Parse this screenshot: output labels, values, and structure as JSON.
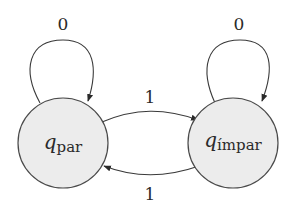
{
  "diagram": {
    "type": "finite-state-automaton",
    "states": [
      {
        "id": "q_par",
        "symbol": "q",
        "subscript": "par",
        "cx": 63,
        "cy": 143,
        "r": 45
      },
      {
        "id": "q_impar",
        "symbol": "q",
        "subscript": "ímpar",
        "cx": 233,
        "cy": 143,
        "r": 45
      }
    ],
    "transitions": [
      {
        "from": "q_par",
        "to": "q_par",
        "label": "0"
      },
      {
        "from": "q_impar",
        "to": "q_impar",
        "label": "0"
      },
      {
        "from": "q_par",
        "to": "q_impar",
        "label": "1"
      },
      {
        "from": "q_impar",
        "to": "q_par",
        "label": "1"
      }
    ],
    "colors": {
      "state_fill": "#ececec",
      "stroke": "#3a3a3a",
      "text": "#2a2a2a"
    }
  }
}
